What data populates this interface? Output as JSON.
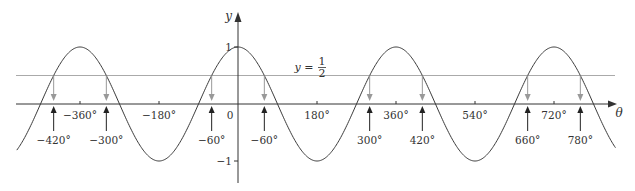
{
  "figure": {
    "function": "cos(theta)",
    "horizontal_line": {
      "value": 0.5,
      "label_prefix": "y =",
      "label_num": "1",
      "label_den": "2"
    },
    "x_axis_label": "θ",
    "y_axis_label": "y",
    "origin_label": "0",
    "y_ticks": [
      {
        "value": 1,
        "label": "1"
      },
      {
        "value": -1,
        "label": "−1"
      }
    ],
    "x_ticks": [
      {
        "value": -360,
        "label": "−360°"
      },
      {
        "value": -180,
        "label": "−180°"
      },
      {
        "value": 180,
        "label": "180°"
      },
      {
        "value": 360,
        "label": "360°"
      },
      {
        "value": 540,
        "label": "540°"
      },
      {
        "value": 720,
        "label": "720°"
      }
    ],
    "solutions": [
      {
        "value": -420,
        "label": "−420°"
      },
      {
        "value": -300,
        "label": "−300°"
      },
      {
        "value": -60,
        "label": "−60°"
      },
      {
        "value": 60,
        "label": "−60°"
      },
      {
        "value": 300,
        "label": "300°"
      },
      {
        "value": 420,
        "label": "420°"
      },
      {
        "value": 660,
        "label": "660°"
      },
      {
        "value": 780,
        "label": "780°"
      }
    ],
    "x_range_deg": [
      -510,
      860
    ],
    "colors": {
      "curve": "#3a3a3a",
      "axis": "#333333",
      "half_line": "#aaaaaa",
      "down_arrow": "#999999",
      "up_arrow": "#222222"
    }
  }
}
